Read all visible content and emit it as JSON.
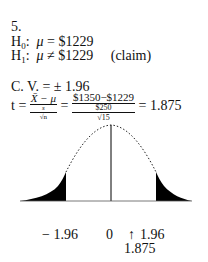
{
  "problem_number": "5.",
  "h0": {
    "label": "H",
    "sub": "0",
    "colon": ":",
    "mu": "μ",
    "rel": "=",
    "value": "$1229"
  },
  "h1": {
    "label": "H",
    "sub": "1",
    "colon": ":",
    "mu": "μ",
    "rel": "≠",
    "value": "$1229",
    "note": "(claim)"
  },
  "cv": {
    "label": "C. V. =",
    "value": "± 1.96"
  },
  "t_formula": {
    "t": "t",
    "eq1": "=",
    "num1": "X̄ − μ",
    "den1_s": "s",
    "den1_n": "√n",
    "eq2": "=",
    "num2": "$1350−$1229",
    "den2_s": "$250",
    "den2_n": "√15",
    "eq3": "=",
    "result": "1.875"
  },
  "axis_labels": {
    "left_cv": "− 1.96",
    "center": "0",
    "arrow": "↑",
    "right_cv": "1.96",
    "test_value": "1.875"
  }
}
